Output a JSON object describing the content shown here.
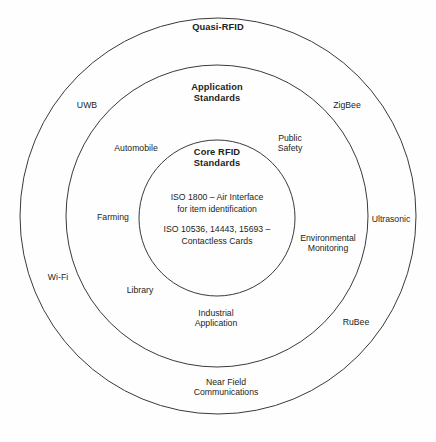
{
  "diagram": {
    "type": "concentric-venn",
    "title_implicit": "RFID standards landscape",
    "background_color": "#fefefe",
    "stroke_color": "#3a3a3a",
    "text_color": "#231f20",
    "rings": [
      {
        "id": "outer",
        "title": "Quasi-RFID",
        "cx": 218,
        "cy": 216,
        "r": 198,
        "title_x": 218,
        "title_y": 27
      },
      {
        "id": "middle",
        "title": "Application\nStandards",
        "cx": 217,
        "cy": 216,
        "r": 151,
        "title_x": 217,
        "title_y": 93
      },
      {
        "id": "inner",
        "title": "Core RFID\nStandards",
        "cx": 217,
        "cy": 218,
        "r": 78,
        "title_x": 217,
        "title_y": 158
      }
    ],
    "core_text": [
      {
        "text": "ISO 1800 – Air Interface\nfor item identification",
        "x": 217,
        "y": 203
      },
      {
        "text": "ISO 10536, 14443, 15693 –\nContactless Cards",
        "x": 217,
        "y": 235
      }
    ],
    "outer_ring_labels": [
      {
        "text": "UWB",
        "x": 87,
        "y": 105
      },
      {
        "text": "ZigBee",
        "x": 347,
        "y": 105
      },
      {
        "text": "Wi-Fi",
        "x": 58,
        "y": 277
      },
      {
        "text": "Ultrasonic",
        "x": 391,
        "y": 219
      },
      {
        "text": "RuBee",
        "x": 356,
        "y": 322
      },
      {
        "text": "Near Field\nCommunications",
        "x": 226,
        "y": 387
      }
    ],
    "middle_ring_labels": [
      {
        "text": "Automobile",
        "x": 136,
        "y": 148
      },
      {
        "text": "Public\nSafety",
        "x": 290,
        "y": 143
      },
      {
        "text": "Farming",
        "x": 113,
        "y": 217
      },
      {
        "text": "Environmental\nMonitoring",
        "x": 328,
        "y": 243
      },
      {
        "text": "Library",
        "x": 140,
        "y": 290
      },
      {
        "text": "Industrial\nApplication",
        "x": 216,
        "y": 318
      }
    ]
  }
}
